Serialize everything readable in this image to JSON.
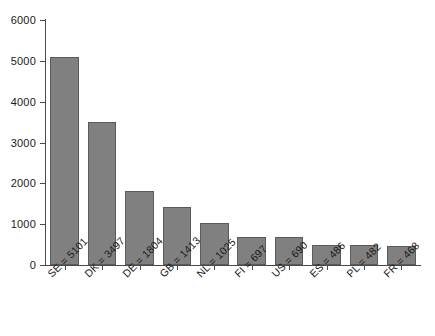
{
  "chart_data": {
    "type": "bar",
    "title": "",
    "subtitle": "",
    "xlabel": "",
    "ylabel": "",
    "categories": [
      "SE = 5101",
      "DK = 3497",
      "DE = 1804",
      "GB = 1413",
      "NL = 1025",
      "FI = 697",
      "US = 690",
      "ES = 486",
      "PL = 482",
      "FR = 468"
    ],
    "codes": [
      "SE",
      "DK",
      "DE",
      "GB",
      "NL",
      "FI",
      "US",
      "ES",
      "PL",
      "FR"
    ],
    "values": [
      5101,
      3497,
      1804,
      1413,
      1025,
      697,
      690,
      486,
      482,
      468
    ],
    "ylim": [
      0,
      6000
    ],
    "ytick_labels": [
      "0",
      "1000",
      "2000",
      "3000",
      "4000",
      "5000",
      "6000"
    ],
    "ytick_values": [
      0,
      1000,
      2000,
      3000,
      4000,
      5000,
      6000
    ],
    "grid": false,
    "legend": null,
    "bar_color": "#808080",
    "bar_edge_color": "#5b5b5b",
    "axis_color": "#4a4a4a",
    "background_color": "#ffffff",
    "xtick_label_rotation": -45
  }
}
